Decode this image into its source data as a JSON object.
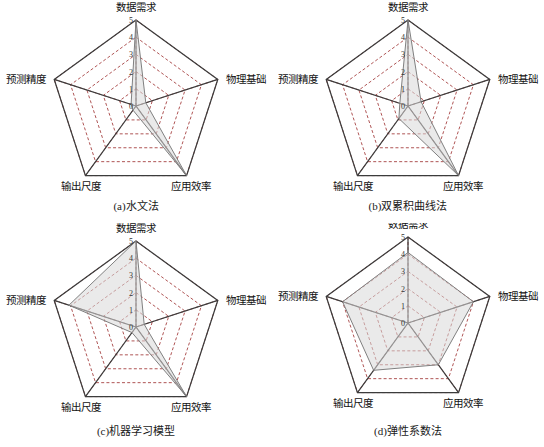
{
  "figure": {
    "background_color": "#ffffff",
    "panel_count": 4
  },
  "chart_data": [
    {
      "type": "radar",
      "panel_id": "a",
      "title": "(a)水文法",
      "categories": [
        "数据需求",
        "物理基础",
        "应用效率",
        "输出尺度",
        "预测精度"
      ],
      "values": [
        5,
        0.6,
        5,
        0.3,
        0.3
      ],
      "rlim": [
        0,
        5
      ],
      "tick_labels": [
        "0",
        "1",
        "2",
        "3",
        "4",
        "5"
      ],
      "grid": true,
      "grid_style": "dashed-pentagon",
      "legend": "none",
      "fill_color": "#d9d9d9",
      "fill_opacity": 0.55,
      "line_color": "#808080",
      "axis_color": "#3c3c3c",
      "gridline_color": "#9a2a2a"
    },
    {
      "type": "radar",
      "panel_id": "b",
      "title": "(b)双累积曲线法",
      "categories": [
        "数据需求",
        "物理基础",
        "应用效率",
        "输出尺度",
        "预测精度"
      ],
      "values": [
        5,
        0.8,
        5,
        0.9,
        0.5
      ],
      "rlim": [
        0,
        5
      ],
      "tick_labels": [
        "0",
        "1",
        "2",
        "3",
        "4",
        "5"
      ],
      "grid": true,
      "grid_style": "dashed-pentagon",
      "legend": "none",
      "fill_color": "#d9d9d9",
      "fill_opacity": 0.55,
      "line_color": "#808080",
      "axis_color": "#3c3c3c",
      "gridline_color": "#9a2a2a"
    },
    {
      "type": "radar",
      "panel_id": "c",
      "title": "(c)机器学习模型",
      "categories": [
        "数据需求",
        "物理基础",
        "应用效率",
        "输出尺度",
        "预测精度"
      ],
      "values": [
        5,
        0.5,
        5,
        0.4,
        4.1
      ],
      "rlim": [
        0,
        5
      ],
      "tick_labels": [
        "0",
        "1",
        "2",
        "3",
        "4",
        "5"
      ],
      "grid": true,
      "grid_style": "dashed-pentagon",
      "legend": "none",
      "fill_color": "#d9d9d9",
      "fill_opacity": 0.55,
      "line_color": "#808080",
      "axis_color": "#3c3c3c",
      "gridline_color": "#9a2a2a"
    },
    {
      "type": "radar",
      "panel_id": "d",
      "title": "(d)弹性系数法",
      "categories": [
        "数据需求",
        "物理基础",
        "应用效率",
        "输出尺度",
        "预测精度"
      ],
      "values": [
        4.1,
        4.0,
        3.0,
        3.4,
        4.0
      ],
      "rlim": [
        0,
        5
      ],
      "tick_labels": [
        "0",
        "1",
        "2",
        "3",
        "4",
        "5"
      ],
      "grid": true,
      "grid_style": "dashed-pentagon",
      "legend": "none",
      "fill_color": "#d9d9d9",
      "fill_opacity": 0.55,
      "line_color": "#808080",
      "axis_color": "#3c3c3c",
      "gridline_color": "#9a2a2a"
    }
  ]
}
